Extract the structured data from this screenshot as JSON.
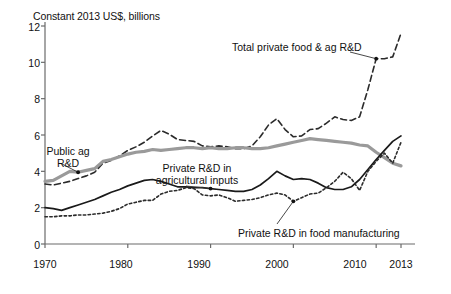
{
  "chart_data": {
    "type": "line",
    "title": "Constant 2013 US$, billions",
    "xlabel": "",
    "ylabel": "Constant 2013 US$, billions",
    "xlim": [
      1970,
      2013
    ],
    "ylim": [
      0,
      12
    ],
    "yticks": [
      0,
      2,
      4,
      6,
      8,
      10,
      12
    ],
    "xticks": [
      1970,
      1980,
      1990,
      2000,
      2010,
      2013
    ],
    "grid": false,
    "legend": "annotations-inline",
    "x": [
      1970,
      1971,
      1972,
      1973,
      1974,
      1975,
      1976,
      1977,
      1978,
      1979,
      1980,
      1981,
      1982,
      1983,
      1984,
      1985,
      1986,
      1987,
      1988,
      1989,
      1990,
      1991,
      1992,
      1993,
      1994,
      1995,
      1996,
      1997,
      1998,
      1999,
      2000,
      2001,
      2002,
      2003,
      2004,
      2005,
      2006,
      2007,
      2008,
      2009,
      2010,
      2011,
      2012,
      2013
    ],
    "series": [
      {
        "name": "Total private food & ag R&D",
        "style": "dashed",
        "color": "#2b2b2b",
        "values": [
          3.3,
          3.25,
          3.35,
          3.45,
          3.6,
          3.75,
          3.95,
          4.45,
          4.6,
          4.85,
          5.15,
          5.35,
          5.6,
          5.95,
          6.25,
          6.05,
          5.75,
          5.7,
          5.65,
          5.4,
          5.35,
          5.4,
          5.35,
          5.25,
          5.25,
          5.4,
          5.9,
          6.55,
          6.9,
          6.3,
          5.9,
          5.95,
          6.3,
          6.35,
          6.65,
          7.0,
          6.85,
          6.8,
          7.0,
          8.5,
          10.2,
          10.2,
          10.3,
          11.6
        ]
      },
      {
        "name": "Public ag R&D",
        "style": "solid-thick-gray",
        "color": "#9a9a9a",
        "values": [
          3.45,
          3.5,
          3.75,
          4.0,
          3.95,
          4.05,
          4.15,
          4.55,
          4.65,
          4.8,
          4.95,
          5.05,
          5.1,
          5.2,
          5.15,
          5.2,
          5.25,
          5.3,
          5.3,
          5.25,
          5.3,
          5.25,
          5.25,
          5.3,
          5.3,
          5.25,
          5.25,
          5.3,
          5.4,
          5.5,
          5.6,
          5.7,
          5.8,
          5.75,
          5.7,
          5.65,
          5.6,
          5.55,
          5.45,
          5.4,
          5.05,
          4.75,
          4.45,
          4.3
        ]
      },
      {
        "name": "Private R&D in agricultural inputs",
        "style": "solid",
        "color": "#1a1a1a",
        "values": [
          2.0,
          1.95,
          1.85,
          2.0,
          2.15,
          2.3,
          2.45,
          2.65,
          2.85,
          3.0,
          3.2,
          3.35,
          3.5,
          3.55,
          3.45,
          3.3,
          3.15,
          3.15,
          3.1,
          3.1,
          3.05,
          3.0,
          2.95,
          2.9,
          2.9,
          3.0,
          3.25,
          3.6,
          4.0,
          3.75,
          3.55,
          3.6,
          3.55,
          3.35,
          3.1,
          3.0,
          3.0,
          3.15,
          3.55,
          4.1,
          4.65,
          5.15,
          5.65,
          5.95
        ]
      },
      {
        "name": "Private R&D in food manufacturing",
        "style": "dotted",
        "color": "#2b2b2b",
        "values": [
          1.5,
          1.5,
          1.55,
          1.55,
          1.6,
          1.6,
          1.65,
          1.7,
          1.8,
          1.95,
          2.2,
          2.3,
          2.4,
          2.4,
          2.75,
          2.9,
          2.95,
          3.1,
          3.05,
          2.7,
          2.65,
          2.7,
          2.55,
          2.35,
          2.4,
          2.45,
          2.55,
          2.7,
          2.8,
          2.7,
          2.35,
          2.55,
          2.75,
          2.8,
          3.1,
          3.45,
          3.95,
          3.6,
          2.95,
          4.0,
          4.55,
          5.0,
          4.45,
          5.6
        ]
      }
    ],
    "annotations": [
      {
        "name": "total-private-food-ag-rd",
        "text_lines": [
          "Total private food & ag R&D"
        ],
        "point": {
          "x": 2010,
          "y": 10.2
        }
      },
      {
        "name": "public-ag-rd",
        "text_lines": [
          "Public ag",
          "R&D"
        ],
        "point": {
          "x": 1974,
          "y": 3.95
        }
      },
      {
        "name": "private-rd-agricultural-inputs",
        "text_lines": [
          "Private R&D in",
          "agricultural inputs"
        ],
        "point": {
          "x": 1990,
          "y": 3.05
        }
      },
      {
        "name": "private-rd-food-manufacturing",
        "text_lines": [
          "Private R&D in food manufacturing"
        ],
        "point": {
          "x": 2000,
          "y": 2.35
        }
      }
    ]
  },
  "axis": {
    "title": "Constant 2013 US$, billions",
    "ytick_labels": [
      "12",
      "10",
      "8",
      "6",
      "4",
      "2",
      "0"
    ],
    "xtick_labels": [
      "1970",
      "1980",
      "1990",
      "2000",
      "2010",
      "2013"
    ]
  },
  "annotation_text": {
    "total": "Total private food & ag R&D",
    "public_line1": "Public ag",
    "public_line2": "R&D",
    "inputs_line1": "Private R&D in",
    "inputs_line2": "agricultural inputs",
    "food": "Private R&D in food manufacturing"
  },
  "colors": {
    "axis": "#6b6b6b",
    "public_ag": "#9a9a9a",
    "private_inputs": "#1a1a1a",
    "total_private": "#2b2b2b",
    "food_manufacturing": "#2b2b2b",
    "text": "#111111",
    "background": "#ffffff"
  }
}
